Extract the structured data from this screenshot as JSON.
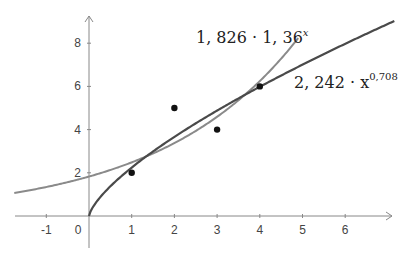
{
  "chart_data": {
    "type": "scatter",
    "title": "",
    "xlabel": "",
    "ylabel": "",
    "xlim": [
      -1.75,
      7
    ],
    "ylim": [
      -0.6,
      9.3
    ],
    "grid": false,
    "x_ticks": [
      -1,
      0,
      1,
      2,
      3,
      4,
      5,
      6
    ],
    "y_ticks": [
      2,
      4,
      6,
      8
    ],
    "points": [
      {
        "x": 1,
        "y": 2
      },
      {
        "x": 2,
        "y": 5
      },
      {
        "x": 3,
        "y": 4
      },
      {
        "x": 4,
        "y": 6
      }
    ],
    "series": [
      {
        "name": "exponential fit",
        "label_main": "1, 826 · 1, 36",
        "label_sup": "x",
        "formula": "1.826 * 1.36^x",
        "a": 1.826,
        "b": 1.36,
        "color": "#8a8a8a",
        "domain": [
          -1.75,
          4.9
        ]
      },
      {
        "name": "power fit",
        "label_main": "2, 242 · x",
        "label_sup": "0,708",
        "formula": "2.242 * x^0.708",
        "a": 2.242,
        "b": 0.708,
        "color": "#4a4a4a",
        "domain": [
          0,
          7.15
        ]
      }
    ]
  },
  "axes": {
    "x_tick_labels": [
      "-1",
      "0",
      "1",
      "2",
      "3",
      "4",
      "5",
      "6"
    ],
    "y_tick_labels": [
      "2",
      "4",
      "6",
      "8"
    ],
    "origin_label": "0"
  }
}
